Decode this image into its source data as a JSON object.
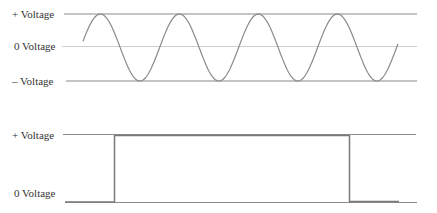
{
  "ac_wave": {
    "labels": {
      "plus": "+ Voltage",
      "zero": "0 Voltage",
      "minus": "– Voltage"
    },
    "type": "sine",
    "cycles": 4
  },
  "dc_wave": {
    "labels": {
      "plus": "+ Voltage",
      "zero": "0 Voltage"
    },
    "type": "square pulse"
  },
  "colors": {
    "line": "#8a8a8a",
    "zero_line": "#c8c8c8",
    "text": "#333333"
  }
}
